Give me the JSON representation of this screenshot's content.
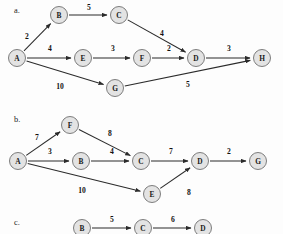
{
  "figure": {
    "background_color": "#fdfdfd",
    "node_fill": "#e3e3e3",
    "node_stroke": "#6f6f6f",
    "edge_color": "#2b2b2b",
    "text_color": "#111111"
  },
  "panels": [
    {
      "id": "a",
      "letter": "a.",
      "letter_pos": {
        "x": 14,
        "y": 10
      },
      "graph": {
        "type": "directed-weighted-graph",
        "nodes": [
          {
            "id": "A",
            "label": "A",
            "x": 17,
            "y": 58,
            "r": 8.5
          },
          {
            "id": "B",
            "label": "B",
            "x": 59,
            "y": 15,
            "r": 8.5
          },
          {
            "id": "C",
            "label": "C",
            "x": 119,
            "y": 15,
            "r": 8.5
          },
          {
            "id": "D",
            "label": "D",
            "x": 196,
            "y": 58,
            "r": 8.5
          },
          {
            "id": "E",
            "label": "E",
            "x": 83,
            "y": 58,
            "r": 8.5
          },
          {
            "id": "F",
            "label": "F",
            "x": 142,
            "y": 58,
            "r": 8.5
          },
          {
            "id": "G",
            "label": "G",
            "x": 115,
            "y": 88,
            "r": 8.5
          },
          {
            "id": "H",
            "label": "H",
            "x": 262,
            "y": 58,
            "r": 8.5
          }
        ],
        "edges": [
          {
            "from": "A",
            "to": "B",
            "weight": "2",
            "label_x": 27,
            "label_y": 36
          },
          {
            "from": "B",
            "to": "C",
            "weight": "5",
            "label_x": 89,
            "label_y": 7
          },
          {
            "from": "C",
            "to": "D",
            "weight": "4",
            "label_x": 162,
            "label_y": 33
          },
          {
            "from": "A",
            "to": "E",
            "weight": "4",
            "label_x": 50,
            "label_y": 48
          },
          {
            "from": "E",
            "to": "F",
            "weight": "3",
            "label_x": 113,
            "label_y": 48
          },
          {
            "from": "F",
            "to": "D",
            "weight": "2",
            "label_x": 169,
            "label_y": 48
          },
          {
            "from": "D",
            "to": "H",
            "weight": "3",
            "label_x": 229,
            "label_y": 48
          },
          {
            "from": "A",
            "to": "G",
            "weight": "10",
            "label_x": 60,
            "label_y": 86
          },
          {
            "from": "G",
            "to": "H",
            "weight": "5",
            "label_x": 188,
            "label_y": 84
          }
        ]
      }
    },
    {
      "id": "b",
      "letter": "b.",
      "letter_pos": {
        "x": 14,
        "y": 119
      },
      "graph": {
        "type": "directed-weighted-graph",
        "nodes": [
          {
            "id": "A",
            "label": "A",
            "x": 18,
            "y": 161,
            "r": 8.5
          },
          {
            "id": "F",
            "label": "F",
            "x": 70,
            "y": 125,
            "r": 8.5
          },
          {
            "id": "B",
            "label": "B",
            "x": 81,
            "y": 161,
            "r": 8.5
          },
          {
            "id": "C",
            "label": "C",
            "x": 141,
            "y": 161,
            "r": 8.5
          },
          {
            "id": "D",
            "label": "D",
            "x": 200,
            "y": 161,
            "r": 8.5
          },
          {
            "id": "G",
            "label": "G",
            "x": 258,
            "y": 161,
            "r": 8.5
          },
          {
            "id": "E",
            "label": "E",
            "x": 152,
            "y": 194,
            "r": 8.5
          }
        ],
        "edges": [
          {
            "from": "A",
            "to": "F",
            "weight": "7",
            "label_x": 37,
            "label_y": 137
          },
          {
            "from": "F",
            "to": "C",
            "weight": "8",
            "label_x": 110,
            "label_y": 133
          },
          {
            "from": "A",
            "to": "B",
            "weight": "3",
            "label_x": 50,
            "label_y": 151
          },
          {
            "from": "B",
            "to": "C",
            "weight": "4",
            "label_x": 112,
            "label_y": 151
          },
          {
            "from": "C",
            "to": "D",
            "weight": "7",
            "label_x": 171,
            "label_y": 151
          },
          {
            "from": "D",
            "to": "G",
            "weight": "2",
            "label_x": 229,
            "label_y": 151
          },
          {
            "from": "A",
            "to": "E",
            "weight": "10",
            "label_x": 82,
            "label_y": 190
          },
          {
            "from": "E",
            "to": "D",
            "weight": "8",
            "label_x": 189,
            "label_y": 192
          }
        ]
      }
    },
    {
      "id": "c",
      "letter": "c.",
      "letter_pos": {
        "x": 14,
        "y": 222
      },
      "graph": {
        "type": "directed-weighted-graph",
        "nodes": [
          {
            "id": "B",
            "label": "B",
            "x": 82,
            "y": 228,
            "r": 8.5
          },
          {
            "id": "C",
            "label": "C",
            "x": 143,
            "y": 228,
            "r": 8.5
          },
          {
            "id": "D",
            "label": "D",
            "x": 203,
            "y": 228,
            "r": 8.5
          }
        ],
        "edges": [
          {
            "from": "B",
            "to": "C",
            "weight": "5",
            "label_x": 112,
            "label_y": 219
          },
          {
            "from": "C",
            "to": "D",
            "weight": "6",
            "label_x": 173,
            "label_y": 219
          }
        ]
      }
    }
  ]
}
